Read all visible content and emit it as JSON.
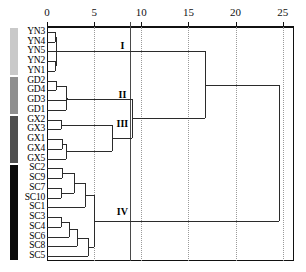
{
  "chart_data": {
    "type": "dendrogram",
    "title": "",
    "xlabel": "",
    "ylabel": "",
    "xlim": [
      0,
      26.2
    ],
    "xticks": [
      0,
      5,
      10,
      15,
      20,
      25
    ],
    "xtick_labels": [
      "0",
      "5",
      "10",
      "15",
      "20",
      "25"
    ],
    "grid": "vertical dotted gridlines at each tick; solid vertical cut line at 8.8",
    "cut_line": 8.8,
    "legend": "none",
    "orientation": "horizontal-left-to-right",
    "leaves": [
      "YN3",
      "YN4",
      "YN5",
      "YN2",
      "YN1",
      "GD2",
      "GD4",
      "GD3",
      "GD1",
      "GX2",
      "GX3",
      "GX1",
      "GX4",
      "GX5",
      "SC2",
      "SC9",
      "SC7",
      "SC10",
      "SC1",
      "SC3",
      "SC4",
      "SC6",
      "SC8",
      "SC5"
    ],
    "groups": [
      {
        "name": "YN",
        "color": "#c9c9c9",
        "members": [
          "YN3",
          "YN4",
          "YN5",
          "YN2",
          "YN1"
        ],
        "cluster": "I"
      },
      {
        "name": "GD",
        "color": "#8f8f8f",
        "members": [
          "GD2",
          "GD4",
          "GD3",
          "GD1"
        ],
        "cluster": "II"
      },
      {
        "name": "GX",
        "color": "#4f4f4f",
        "members": [
          "GX2",
          "GX3",
          "GX1",
          "GX4",
          "GX5"
        ],
        "cluster": "III"
      },
      {
        "name": "SC",
        "color": "#0a0a0a",
        "members": [
          "SC2",
          "SC9",
          "SC7",
          "SC10",
          "SC1",
          "SC3",
          "SC4",
          "SC6",
          "SC8",
          "SC5"
        ],
        "cluster": "IV"
      }
    ],
    "cluster_labels": [
      {
        "id": "I",
        "x": 8.0,
        "leaf_index": 2
      },
      {
        "id": "II",
        "x": 8.0,
        "leaf_index": 7
      },
      {
        "id": "III",
        "x": 8.0,
        "leaf_index": 10
      },
      {
        "id": "IV",
        "x": 8.0,
        "leaf_index": 19
      }
    ],
    "merges": [
      {
        "id": "m1",
        "left": "YN3",
        "right": "YN4",
        "height": 0.85
      },
      {
        "id": "m2",
        "left": "YN2",
        "right": "YN1",
        "height": 0.85
      },
      {
        "id": "m3",
        "left": "m1",
        "right": "m2",
        "height": 0.95
      },
      {
        "id": "m4",
        "left": "m3",
        "right": "YN5",
        "height": 1.0
      },
      {
        "id": "m5",
        "left": "GD2",
        "right": "GD4",
        "height": 0.95
      },
      {
        "id": "m6",
        "left": "m5",
        "right": "GD1",
        "height": 2.0
      },
      {
        "id": "m7",
        "left": "m6",
        "right": "GD3",
        "height": 2.1
      },
      {
        "id": "m8",
        "left": "GX2",
        "right": "GX3",
        "height": 1.5
      },
      {
        "id": "m9",
        "left": "GX1",
        "right": "GX4",
        "height": 1.6
      },
      {
        "id": "m10",
        "left": "m9",
        "right": "GX5",
        "height": 2.0
      },
      {
        "id": "m11",
        "left": "m8",
        "right": "m10",
        "height": 6.9
      },
      {
        "id": "m12",
        "left": "m7",
        "right": "m11",
        "height": 9.0
      },
      {
        "id": "m13",
        "left": "m4",
        "right": "m12",
        "height": 16.8
      },
      {
        "id": "m14",
        "left": "SC2",
        "right": "SC9",
        "height": 1.6
      },
      {
        "id": "m15",
        "left": "SC7",
        "right": "SC10",
        "height": 1.5
      },
      {
        "id": "m16",
        "left": "m14",
        "right": "m15",
        "height": 2.9
      },
      {
        "id": "m17",
        "left": "m16",
        "right": "SC1",
        "height": 4.0
      },
      {
        "id": "m18",
        "left": "SC3",
        "right": "SC4",
        "height": 1.5
      },
      {
        "id": "m19",
        "left": "m18",
        "right": "SC6",
        "height": 2.3
      },
      {
        "id": "m20",
        "left": "m19",
        "right": "SC8",
        "height": 3.2
      },
      {
        "id": "m21",
        "left": "m20",
        "right": "SC5",
        "height": 4.3
      },
      {
        "id": "m22",
        "left": "m17",
        "right": "m21",
        "height": 5.0
      },
      {
        "id": "m23",
        "left": "m13",
        "right": "m22",
        "height": 24.6
      }
    ]
  }
}
